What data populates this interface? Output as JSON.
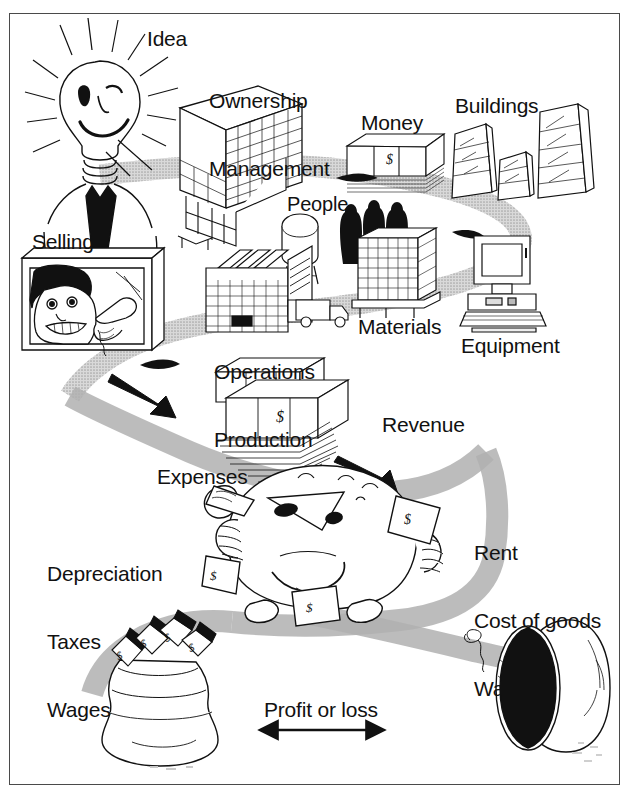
{
  "diagram": {
    "type": "hand-drawn business flow illustration",
    "frame_color": "#4a4a4a",
    "path_color": "#9a9a9a",
    "background": "#ffffff",
    "ink_color": "#111111"
  },
  "labels": {
    "idea": "Idea",
    "ownership": "Ownership",
    "management": "Management",
    "money": "Money",
    "buildings": "Buildings",
    "people": "People",
    "selling": "Selling",
    "operations": "Operations",
    "production": "Production",
    "materials": "Materials",
    "equipment": "Equipment",
    "revenue": "Revenue",
    "expenses": "Expenses",
    "depreciation": "Depreciation",
    "taxes": "Taxes",
    "wages": "Wages",
    "rent": "Rent",
    "cost_of_goods": "Cost of goods",
    "waste": "Waste",
    "profit_or_loss": "Profit or loss"
  },
  "flow": {
    "inputs": [
      "Idea",
      "Ownership",
      "Management",
      "Money",
      "Buildings",
      "People",
      "Materials",
      "Equipment"
    ],
    "process": [
      "Operations",
      "Production",
      "Selling"
    ],
    "outputs": [
      "Revenue",
      "Expenses"
    ],
    "expense_items_left": [
      "Depreciation",
      "Taxes",
      "Wages"
    ],
    "expense_items_right": [
      "Rent",
      "Cost of goods",
      "Waste"
    ],
    "result": "Profit or loss"
  },
  "icons": {
    "lightbulb_person": "lightbulb-head-person-icon",
    "cube": "management-cube-icon",
    "money_stack": "money-stack-icon",
    "buildings": "buildings-icon",
    "people": "people-silhouettes-icon",
    "water_tower": "water-tower-icon",
    "factory": "factory-icon",
    "truck": "delivery-truck-icon",
    "pallet": "materials-pallet-icon",
    "computer": "desktop-computer-icon",
    "tv_salesman": "tv-salesperson-icon",
    "cash_bundles": "revenue-cash-bundles-icon",
    "expense_monster": "expense-monster-icon",
    "money_bag": "money-bag-icon",
    "empty_pipe": "empty-pipe-icon",
    "arrow_right": "arrow-right-icon",
    "double_arrow": "double-headed-arrow-icon"
  }
}
